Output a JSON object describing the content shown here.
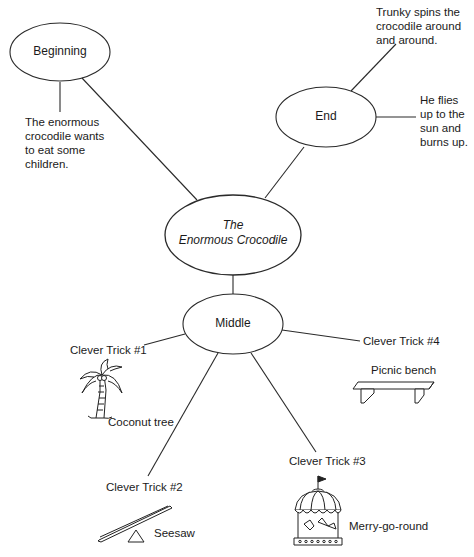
{
  "diagram": {
    "type": "story-map",
    "center": {
      "line1": "The",
      "line2": "Enormous Crocodile"
    },
    "nodes": {
      "beginning": {
        "label": "Beginning",
        "note": "The enormous\ncrocodile wants\nto eat some\nchildren."
      },
      "end": {
        "label": "End",
        "notes": [
          "Trunky spins the\ncrocodile around\nand around.",
          "He flies\nup to the\nsun and\nburns up."
        ]
      },
      "middle": {
        "label": "Middle",
        "tricks": [
          {
            "label": "Clever Trick #1",
            "item": "Coconut tree",
            "icon": "palm-tree-icon"
          },
          {
            "label": "Clever Trick #2",
            "item": "Seesaw",
            "icon": "seesaw-icon"
          },
          {
            "label": "Clever Trick #3",
            "item": "Merry-go-round",
            "icon": "carousel-icon"
          },
          {
            "label": "Clever Trick #4",
            "item": "Picnic bench",
            "icon": "bench-icon"
          }
        ]
      }
    },
    "colors": {
      "line": "#2a2a2a",
      "background": "#ffffff",
      "text": "#1a1a1a"
    }
  }
}
